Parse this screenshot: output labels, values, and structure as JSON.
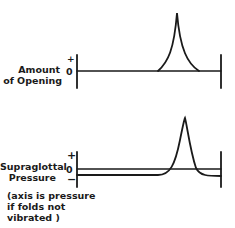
{
  "top_panel": {
    "label_line1": "Amount",
    "label_line2": "of Opening",
    "tick_top": "+",
    "tick_zero": "0"
  },
  "bottom_panel": {
    "label_line1": "Supraglottal",
    "label_line2": "Pressure",
    "tick_plus": "+",
    "tick_zero": "0",
    "tick_minus": "−",
    "note_line1": "(axis is pressure",
    "note_line2": "if folds not",
    "note_line3": "vibrated )"
  },
  "colors": {
    "ink": "#1a1a1a",
    "background": "#ffffff"
  }
}
